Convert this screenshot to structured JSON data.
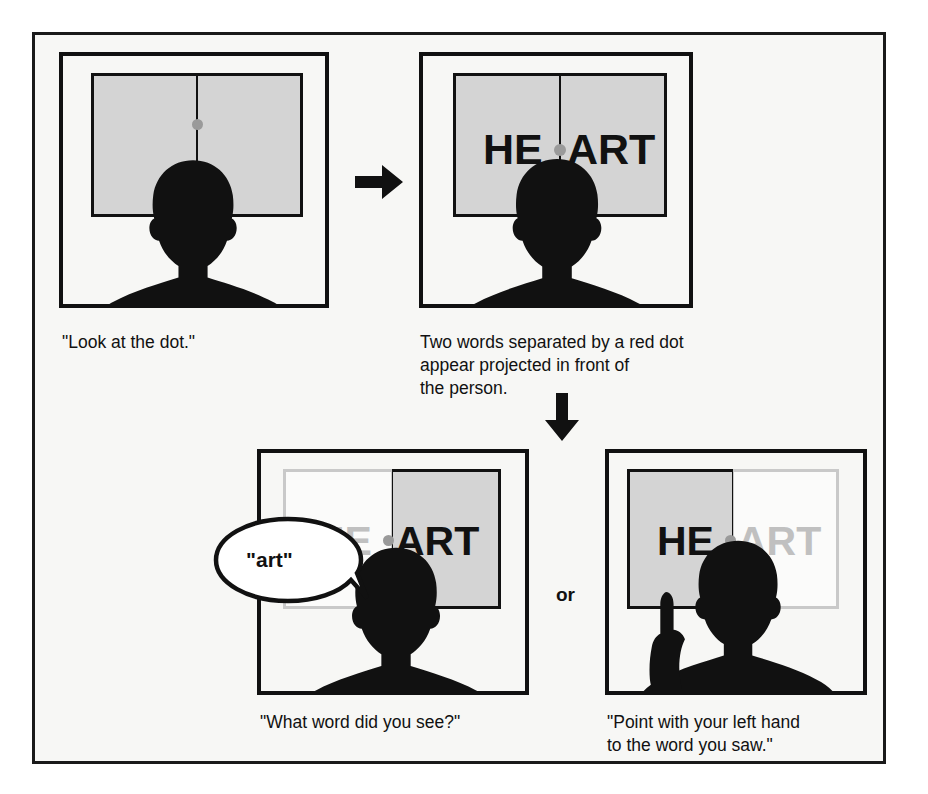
{
  "figure": {
    "background_color": "#f7f7f5",
    "frame_color": "#1a1a1a"
  },
  "colors": {
    "ink": "#111111",
    "screen_gray": "#d4d4d4",
    "faded_text": "#c0c0c0",
    "dot_gray": "#9a9a9a",
    "page": "#f7f7f5"
  },
  "panels": [
    {
      "id": "panel-look-at-dot",
      "caption": "\"Look at the dot.\"",
      "word_left": "",
      "word_right": "",
      "left_half_style": "gray",
      "right_half_style": "gray",
      "has_dot": true,
      "has_hand": false,
      "has_bubble": false
    },
    {
      "id": "panel-heart-projected",
      "caption": "Two words separated by a red dot\nappear projected in front of\nthe person.",
      "word_left": "HE",
      "word_right": "ART",
      "left_half_style": "gray",
      "right_half_style": "gray",
      "has_dot": true,
      "has_hand": false,
      "has_bubble": false
    },
    {
      "id": "panel-what-word",
      "caption": "\"What word did you see?\"",
      "word_left": "HE",
      "word_right": "ART",
      "left_half_style": "faded",
      "right_half_style": "gray",
      "left_word_shade": "light",
      "right_word_shade": "dark",
      "has_dot": true,
      "has_hand": false,
      "has_bubble": true,
      "bubble_text": "\"art\""
    },
    {
      "id": "panel-point-with-hand",
      "caption": "\"Point with your left hand\nto the word you saw.\"",
      "word_left": "HE",
      "word_right": "ART",
      "left_half_style": "gray",
      "right_half_style": "faded",
      "left_word_shade": "dark",
      "right_word_shade": "light",
      "has_dot": true,
      "has_hand": true,
      "has_bubble": false
    }
  ],
  "connectors": {
    "arrow_right": "arrow-right-icon",
    "arrow_down": "arrow-down-icon",
    "or_label": "or"
  }
}
